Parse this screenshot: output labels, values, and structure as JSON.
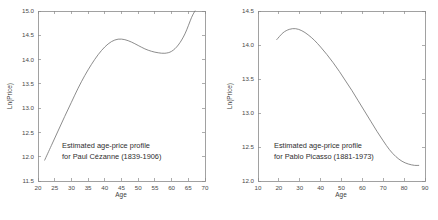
{
  "figure": {
    "background_color": "#ffffff",
    "axis_color": "#8a8a8a",
    "curve_color": "#6e6e6e",
    "text_color": "#2e2e2e"
  },
  "chart_data": [
    {
      "type": "line",
      "panel": "left",
      "title": "",
      "annotation_line1": "Estimated age-price profile",
      "annotation_line2": "for Paul Cézanne (1839-1906)",
      "xlabel": "Age",
      "ylabel": "Ln(Price)",
      "xlim": [
        20,
        70
      ],
      "ylim": [
        11.5,
        15.0
      ],
      "xticks": [
        20,
        25,
        30,
        35,
        40,
        45,
        50,
        55,
        60,
        65,
        70
      ],
      "xtick_labels": [
        "20",
        "25",
        "30",
        "35",
        "40",
        "45",
        "50",
        "55",
        "60",
        "65",
        "70"
      ],
      "yticks": [
        11.5,
        12.0,
        12.5,
        13.0,
        13.5,
        14.0,
        14.5,
        15.0
      ],
      "ytick_labels": [
        "11.5",
        "12.0",
        "12.5",
        "13.0",
        "13.5",
        "14.0",
        "14.5",
        "15.0"
      ],
      "grid": false,
      "legend": "none",
      "x": [
        22,
        24,
        26,
        28,
        30,
        32,
        34,
        36,
        38,
        40,
        42,
        44,
        46,
        48,
        50,
        52,
        54,
        56,
        58,
        60,
        62,
        64,
        66,
        67
      ],
      "y": [
        11.93,
        12.23,
        12.53,
        12.83,
        13.12,
        13.41,
        13.67,
        13.9,
        14.1,
        14.26,
        14.37,
        14.42,
        14.41,
        14.36,
        14.29,
        14.22,
        14.17,
        14.14,
        14.13,
        14.17,
        14.3,
        14.53,
        14.87,
        15.0
      ]
    },
    {
      "type": "line",
      "panel": "right",
      "title": "",
      "annotation_line1": "Estimated age-price profile",
      "annotation_line2": "for Pablo Picasso (1881-1973)",
      "xlabel": "Age",
      "ylabel": "Ln(Price)",
      "xlim": [
        10,
        90
      ],
      "ylim": [
        12.0,
        14.5
      ],
      "xticks": [
        10,
        20,
        30,
        40,
        50,
        60,
        70,
        80,
        90
      ],
      "xtick_labels": [
        "10",
        "20",
        "30",
        "40",
        "50",
        "60",
        "70",
        "80",
        "90"
      ],
      "yticks": [
        12.0,
        12.5,
        13.0,
        13.5,
        14.0,
        14.5
      ],
      "ytick_labels": [
        "12.0",
        "12.5",
        "13.0",
        "13.5",
        "14.0",
        "14.5"
      ],
      "grid": false,
      "legend": "none",
      "x": [
        19,
        22,
        25,
        28,
        31,
        34,
        37,
        40,
        43,
        46,
        49,
        52,
        55,
        58,
        61,
        64,
        67,
        70,
        73,
        76,
        79,
        82,
        85,
        87
      ],
      "y": [
        14.08,
        14.18,
        14.23,
        14.24,
        14.21,
        14.15,
        14.07,
        13.97,
        13.86,
        13.74,
        13.61,
        13.47,
        13.33,
        13.18,
        13.03,
        12.88,
        12.73,
        12.59,
        12.46,
        12.36,
        12.29,
        12.25,
        12.23,
        12.23
      ]
    }
  ]
}
